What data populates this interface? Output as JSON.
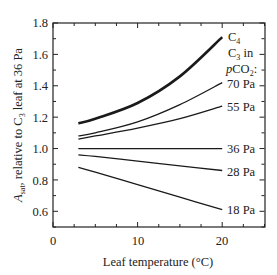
{
  "chart_data": {
    "type": "line",
    "title": "",
    "xlabel": "Leaf temperature (°C)",
    "ylabel": "A_sat, relative to C3 leaf at 36 Pa",
    "xlim": [
      0,
      25
    ],
    "ylim": [
      0.5,
      1.8
    ],
    "xticks": [
      0,
      10,
      20
    ],
    "yticks": [
      0.6,
      0.8,
      1.0,
      1.2,
      1.4,
      1.6,
      1.8
    ],
    "grid": false,
    "legend_header": [
      "C3 in",
      "pCO2:"
    ],
    "x": [
      3,
      5,
      10,
      15,
      20
    ],
    "series": [
      {
        "name": "C4",
        "label": "C4",
        "values": [
          1.16,
          1.19,
          1.29,
          1.46,
          1.71
        ],
        "bold": true
      },
      {
        "name": "C3 70 Pa",
        "label": "70 Pa",
        "values": [
          1.08,
          1.1,
          1.17,
          1.28,
          1.42
        ]
      },
      {
        "name": "C3 55 Pa",
        "label": "55 Pa",
        "values": [
          1.06,
          1.08,
          1.13,
          1.19,
          1.27
        ]
      },
      {
        "name": "C3 36 Pa",
        "label": "36 Pa",
        "values": [
          1.0,
          1.0,
          1.0,
          1.0,
          1.0
        ]
      },
      {
        "name": "C3 28 Pa",
        "label": "28 Pa",
        "values": [
          0.96,
          0.95,
          0.92,
          0.89,
          0.86
        ]
      },
      {
        "name": "C3 18 Pa",
        "label": "18 Pa",
        "values": [
          0.88,
          0.85,
          0.77,
          0.69,
          0.61
        ]
      }
    ]
  },
  "labels": {
    "c4": "C",
    "c4_sub": "4",
    "c3": "C",
    "c3_sub": "3",
    "c3_in": " in",
    "pco2_p": "p",
    "pco2_co": "CO",
    "pco2_sub": "2",
    "pco2_colon": ":",
    "p70": "70 Pa",
    "p55": "55 Pa",
    "p36": "36 Pa",
    "p28": "28 Pa",
    "p18": "18 Pa",
    "xlabel": "Leaf temperature (°C)",
    "ylabel_a": "A",
    "ylabel_sub": "sat",
    "ylabel_rest": ", relative to C",
    "ylabel_sub3": "3",
    "ylabel_end": " leaf at 36 Pa",
    "xt0": "0",
    "xt10": "10",
    "xt20": "20",
    "yt06": "0.6",
    "yt08": "0.8",
    "yt10": "1.0",
    "yt12": "1.2",
    "yt14": "1.4",
    "yt16": "1.6",
    "yt18": "1.8"
  }
}
